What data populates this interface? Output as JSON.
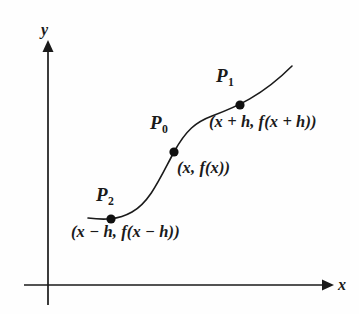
{
  "figure": {
    "type": "calculus-secant-diagram",
    "background_color": "#fefefe",
    "ink_color": "#1a1a1a"
  },
  "axes": {
    "y_label": "y",
    "x_label": "x",
    "origin": {
      "x": 48,
      "y": 285
    },
    "y_axis_top": {
      "x": 48,
      "y": 44
    },
    "x_axis_left": {
      "x": 24,
      "y": 285
    },
    "x_axis_right": {
      "x": 330,
      "y": 285
    },
    "arrowheads": "solid-triangle"
  },
  "curve": {
    "shape": "sigmoid",
    "stroke_width": 1.6,
    "start": {
      "x": 88,
      "y": 218
    },
    "end": {
      "x": 292,
      "y": 66
    },
    "path": "M 88 218 C 104 220 118 220 132 212 C 150 202 160 178 174 152 C 186 130 196 122 212 116 C 236 107 262 96 292 66"
  },
  "points": [
    {
      "id": "P1",
      "name_text": "P",
      "subscript": "1",
      "label": "(x + h, f(x + h))",
      "dot": {
        "x": 240,
        "y": 105
      },
      "dot_radius": 4.6
    },
    {
      "id": "P0",
      "name_text": "P",
      "subscript": "0",
      "label": "(x, f(x))",
      "dot": {
        "x": 174,
        "y": 152
      },
      "dot_radius": 4.6
    },
    {
      "id": "P2",
      "name_text": "P",
      "subscript": "2",
      "label": "(x − h, f(x − h))",
      "dot": {
        "x": 111,
        "y": 219
      },
      "dot_radius": 4.6
    }
  ]
}
